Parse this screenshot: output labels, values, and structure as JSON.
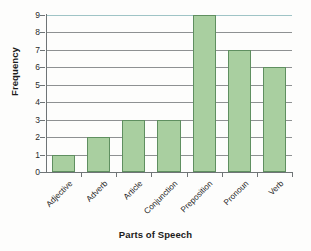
{
  "chart_data": {
    "type": "bar",
    "title": "",
    "xlabel": "Parts of Speech",
    "ylabel": "Frequency",
    "categories": [
      "Adjective",
      "Adverb",
      "Article",
      "Conjunction",
      "Preposition",
      "Pronoun",
      "Verb"
    ],
    "values": [
      1,
      2,
      3,
      3,
      9,
      7,
      6
    ],
    "ylim": [
      0,
      9
    ],
    "ytick_labels": [
      "9",
      "8",
      "7",
      "6",
      "5",
      "4",
      "3",
      "2",
      "1",
      "0"
    ],
    "yticks": [
      9,
      8,
      7,
      6,
      5,
      4,
      3,
      2,
      1,
      0
    ],
    "grid": true,
    "grid_axis": "y",
    "legend": false,
    "legend_position": "none",
    "bar_fill_color": "#a9cfa0",
    "bar_edge_color": "#5f8f60",
    "gridline_color": "#8e9192",
    "axis_color": "#6f7476",
    "background_color": "#fdfdfc",
    "text_color": "#1b1b1b"
  }
}
